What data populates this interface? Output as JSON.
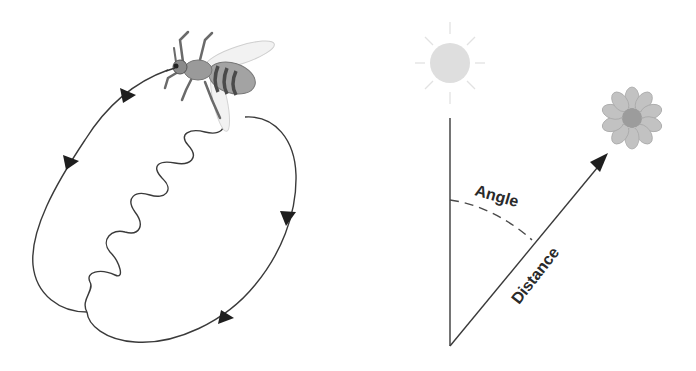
{
  "diagram": {
    "type": "honeybee-waggle-dance",
    "left_panel": {
      "name": "waggle-dance-path",
      "elements": [
        "bee",
        "left-return-loop",
        "waggle-run",
        "right-return-loop"
      ],
      "arrows": 4
    },
    "right_panel": {
      "name": "direction-encoding",
      "labels": {
        "angle": "Angle",
        "distance": "Distance"
      },
      "elements": [
        "sun",
        "vertical-reference-line",
        "distance-arrow",
        "flower",
        "angle-arc"
      ]
    },
    "colors": {
      "line": "#3a3a3a",
      "arrowhead": "#1e1e1e",
      "sun": "#dcdcdc",
      "flower_petal": "#bdbdbd",
      "flower_center": "#9a9a9a",
      "bee_body": "#9e9e9e",
      "bee_stripes": "#4a4a4a",
      "bee_wing": "#f0f0f0"
    }
  }
}
